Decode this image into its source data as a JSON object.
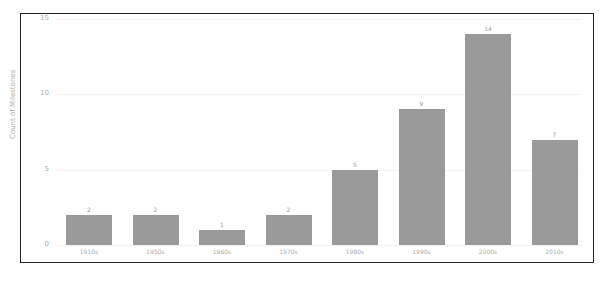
{
  "chart_data": {
    "type": "bar",
    "title": "",
    "xlabel": "",
    "ylabel": "Count of Milestones",
    "ylim": [
      0,
      15
    ],
    "yticks": [
      0,
      5,
      10,
      15
    ],
    "grid": true,
    "legend": null,
    "categories": [
      "1910s",
      "1950s",
      "1960s",
      "1970s",
      "1980s",
      "1990s",
      "2000s",
      "2010s"
    ],
    "values": [
      2,
      2,
      1,
      2,
      5,
      9,
      14,
      7
    ],
    "bar_color": "#9a9a9a"
  }
}
